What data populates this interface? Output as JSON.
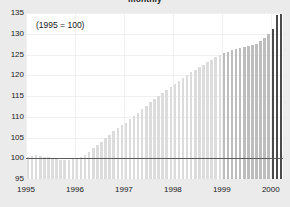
{
  "chart_data": {
    "type": "bar",
    "title": "monthly",
    "annotation": "(1995 = 100)",
    "xlabel": "",
    "ylabel": "",
    "ylim": [
      95,
      135
    ],
    "xlim": [
      1995.0,
      2000.25
    ],
    "yticks": [
      135,
      130,
      125,
      120,
      115,
      110,
      105,
      100,
      95
    ],
    "xticks": [
      "1995",
      "1996",
      "1997",
      "1998",
      "1999",
      "2000"
    ],
    "xtick_values": [
      1995,
      1996,
      1997,
      1998,
      1999,
      2000
    ],
    "grid": true,
    "legend": null,
    "baseline": 100,
    "colors": {
      "background": "#ebebeb",
      "plot_background": "#ffffff",
      "gridline": "#f0f0f2",
      "baseline": "#5a5a5a",
      "bar_light": "#dcdcdc",
      "bar_medium": "#bdbdbd",
      "bar_dark": "#4a4a4a",
      "text": "#1a1a1a"
    },
    "series": [
      {
        "name": "index",
        "x": [
          1995.0,
          1995.083,
          1995.167,
          1995.25,
          1995.333,
          1995.417,
          1995.5,
          1995.583,
          1995.667,
          1995.75,
          1995.833,
          1995.917,
          1996.0,
          1996.083,
          1996.167,
          1996.25,
          1996.333,
          1996.417,
          1996.5,
          1996.583,
          1996.667,
          1996.75,
          1996.833,
          1996.917,
          1997.0,
          1997.083,
          1997.167,
          1997.25,
          1997.333,
          1997.417,
          1997.5,
          1997.583,
          1997.667,
          1997.75,
          1997.833,
          1997.917,
          1998.0,
          1998.083,
          1998.167,
          1998.25,
          1998.333,
          1998.417,
          1998.5,
          1998.583,
          1998.667,
          1998.75,
          1998.833,
          1998.917,
          1999.0,
          1999.083,
          1999.167,
          1999.25,
          1999.333,
          1999.417,
          1999.5,
          1999.583,
          1999.667,
          1999.75,
          1999.833,
          1999.917,
          2000.0,
          2000.083,
          2000.167
        ],
        "values": [
          100.2,
          100.5,
          100.7,
          100.6,
          100.4,
          100.2,
          100.0,
          99.7,
          99.5,
          99.5,
          99.6,
          99.8,
          100.0,
          100.3,
          100.9,
          101.6,
          102.4,
          103.2,
          104.0,
          104.9,
          105.7,
          106.5,
          107.2,
          107.9,
          108.6,
          109.4,
          110.2,
          111.0,
          111.9,
          112.7,
          113.5,
          114.3,
          115.1,
          115.8,
          116.5,
          117.2,
          117.9,
          118.6,
          119.3,
          120.0,
          120.7,
          121.3,
          121.9,
          122.5,
          123.1,
          123.7,
          124.3,
          124.8,
          125.3,
          125.7,
          126.0,
          126.3,
          126.6,
          126.9,
          127.1,
          127.3,
          127.6,
          128.2,
          129.0,
          130.0,
          131.2,
          134.6,
          134.7
        ],
        "shades": [
          "light",
          "light",
          "light",
          "light",
          "light",
          "light",
          "light",
          "light",
          "light",
          "light",
          "light",
          "light",
          "light",
          "light",
          "light",
          "light",
          "light",
          "light",
          "light",
          "light",
          "light",
          "light",
          "light",
          "light",
          "light",
          "light",
          "light",
          "light",
          "light",
          "light",
          "light",
          "light",
          "light",
          "light",
          "light",
          "light",
          "light",
          "light",
          "light",
          "light",
          "light",
          "light",
          "light",
          "light",
          "light",
          "light",
          "light",
          "light",
          "medium",
          "medium",
          "medium",
          "medium",
          "medium",
          "medium",
          "medium",
          "medium",
          "medium",
          "medium",
          "medium",
          "medium",
          "dark",
          "dark",
          "dark"
        ]
      }
    ]
  }
}
